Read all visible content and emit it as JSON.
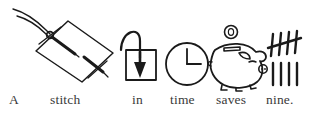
{
  "page": {
    "type": "rebus-illustration",
    "proverb": "A stitch in time saves nine.",
    "background_color": "#ffffff",
    "ink_color": "#1a1a1a",
    "text_color": "#3a3a3a"
  },
  "icons": [
    {
      "id": "stitch",
      "name": "needle-and-thread-icon",
      "depicts": "a sewing needle with trailing thread passing in and out of a piece of fabric",
      "word": "stitch"
    },
    {
      "id": "in",
      "name": "arrow-into-box-icon",
      "depicts": "a curved arrow looping over and pointing down into an open square box",
      "word": "in"
    },
    {
      "id": "time",
      "name": "clock-icon",
      "depicts": "an analog clock face with hands at twelve and three",
      "word": "time"
    },
    {
      "id": "saves",
      "name": "piggy-bank-icon",
      "depicts": "a piggy bank with a coin dropping into its slot",
      "word": "saves"
    },
    {
      "id": "nine",
      "name": "tally-marks-icon",
      "depicts": "tally marks totalling nine: a crossed group of five above four single strokes",
      "word": "nine",
      "tally_total": 9,
      "tally_groups": [
        5,
        4
      ]
    }
  ],
  "caption": {
    "words": [
      {
        "text": "A"
      },
      {
        "text": "stitch"
      },
      {
        "text": "in"
      },
      {
        "text": "time"
      },
      {
        "text": "saves"
      },
      {
        "text": "nine."
      }
    ]
  }
}
